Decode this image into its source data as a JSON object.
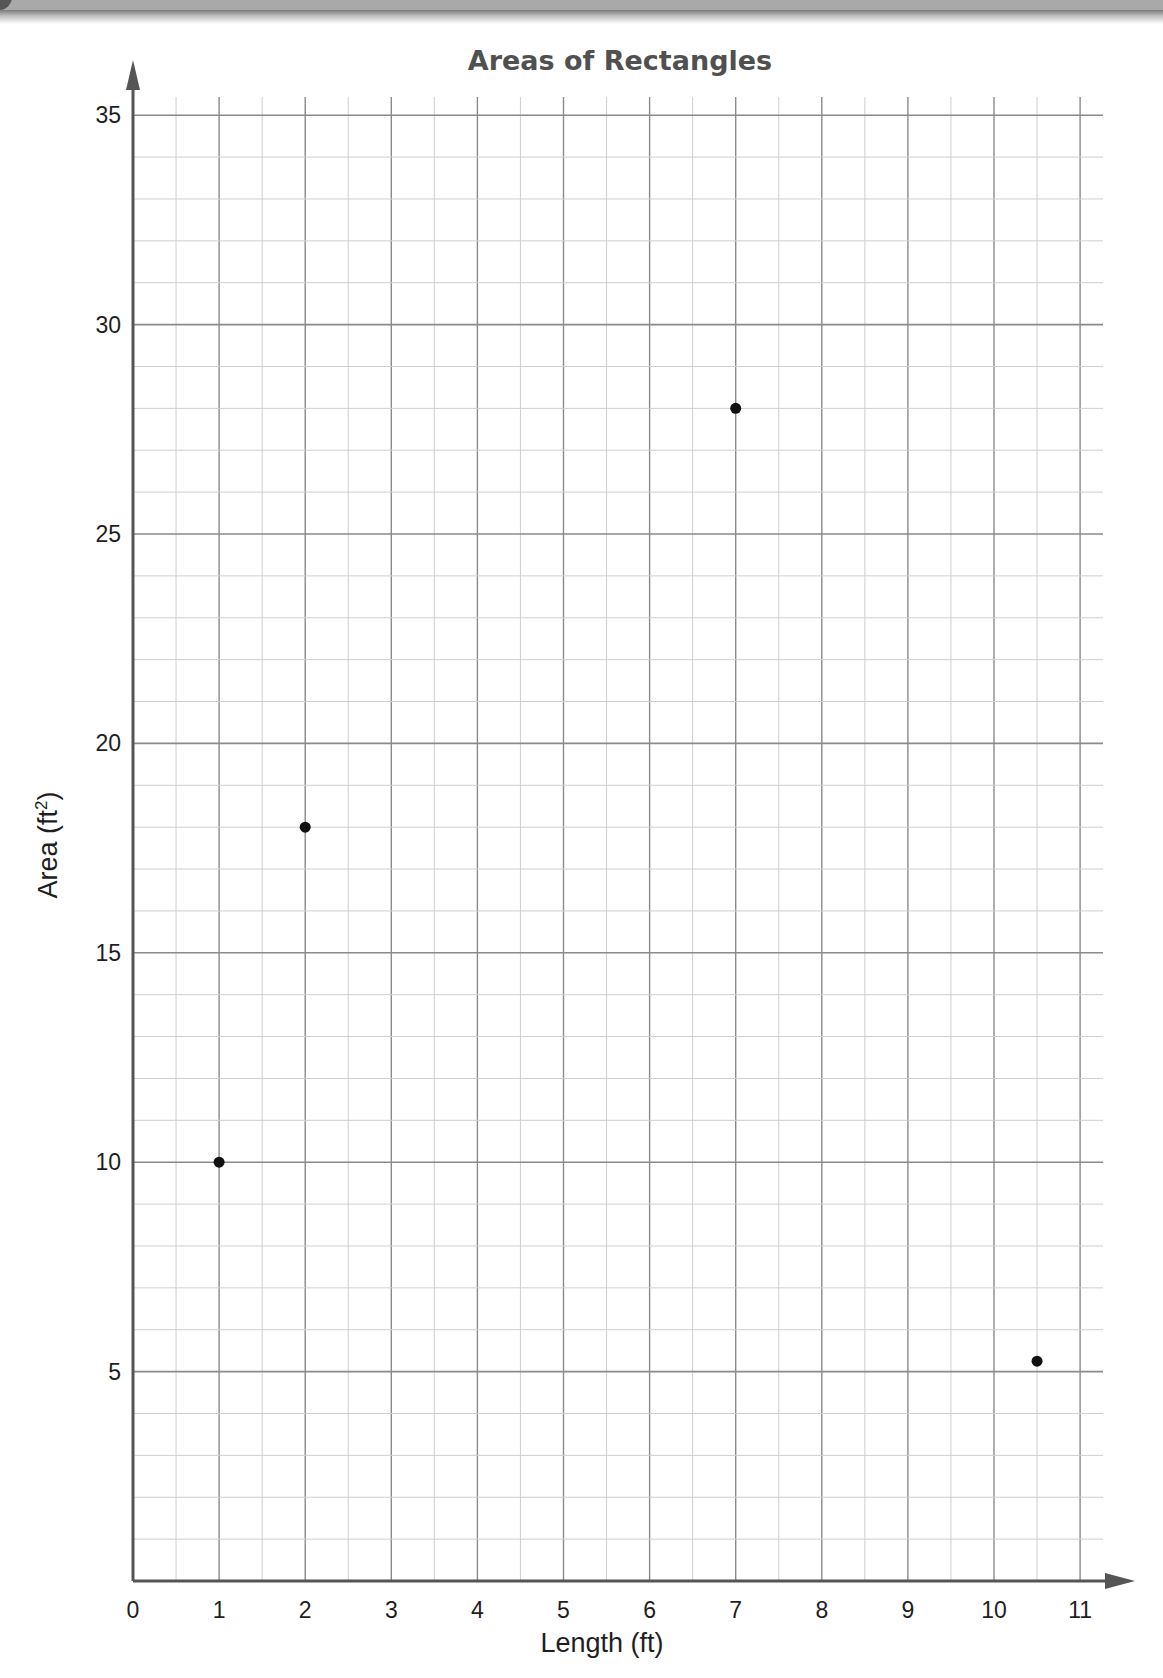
{
  "chart_data": {
    "type": "scatter",
    "title": "Areas of Rectangles",
    "xlabel": "Length (ft)",
    "ylabel": "Area (ft²)",
    "ylabel_base": "Area (ft",
    "ylabel_sup": "2",
    "ylabel_close": ")",
    "xlim": [
      0,
      11
    ],
    "ylim": [
      0,
      35
    ],
    "x_ticks": [
      0,
      1,
      2,
      3,
      4,
      5,
      6,
      7,
      8,
      9,
      10,
      11
    ],
    "y_ticks": [
      5,
      10,
      15,
      20,
      25,
      30,
      35
    ],
    "grid": true,
    "legend": null,
    "series": [
      {
        "name": "Rectangles",
        "points": [
          {
            "x": 1,
            "y": 10
          },
          {
            "x": 2,
            "y": 18
          },
          {
            "x": 7,
            "y": 28
          },
          {
            "x": 10.5,
            "y": 5.25
          }
        ]
      }
    ]
  },
  "colors": {
    "axis": "#555555",
    "major_grid": "#8a8a8a",
    "minor_grid": "#cfcfcf",
    "point": "#111111",
    "title": "#505050"
  }
}
